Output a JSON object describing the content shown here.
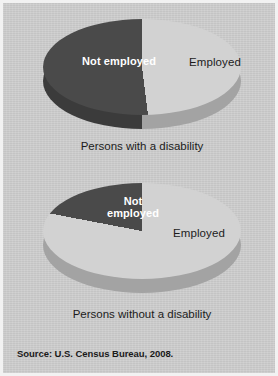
{
  "figure": {
    "background_color": "#cccccc",
    "frame_color": "#f2f2f2",
    "source_note": "Source: U.S. Census Bureau, 2008."
  },
  "palette": {
    "not_employed": "#4a4a4a",
    "not_employed_wall": "#3b3b3b",
    "employed": "#d2d2d2",
    "employed_wall": "#a3a3a3",
    "label_dark_text": "#ffffff",
    "label_light_text": "#1c1c1c"
  },
  "chart_data": [
    {
      "type": "pie",
      "id": "persons-with-a-disability",
      "title": "Persons with a disability",
      "caption": "Persons with a disability",
      "categories": [
        "Not employed",
        "Employed"
      ],
      "values": [
        52,
        48
      ],
      "value_unit": "percent",
      "colors": [
        "#4a4a4a",
        "#d2d2d2"
      ],
      "labels": [
        {
          "text": "Not employed",
          "slice": "Not employed",
          "style": "bold-white"
        },
        {
          "text": "Employed",
          "slice": "Employed",
          "style": "regular-dark"
        }
      ],
      "legend": "none",
      "three_d": true,
      "start_angle_deg": 0,
      "direction": "counterclockwise"
    },
    {
      "type": "pie",
      "id": "persons-without-a-disability",
      "title": "Persons without a disability",
      "caption": "Persons without a disability",
      "categories": [
        "Not employed",
        "Employed"
      ],
      "values": [
        22,
        78
      ],
      "value_unit": "percent",
      "colors": [
        "#4a4a4a",
        "#d2d2d2"
      ],
      "labels": [
        {
          "text": "Not\nemployed",
          "slice": "Not employed",
          "style": "bold-white"
        },
        {
          "text": "Employed",
          "slice": "Employed",
          "style": "regular-dark"
        }
      ],
      "legend": "none",
      "three_d": true,
      "start_angle_deg": 0,
      "direction": "counterclockwise"
    }
  ],
  "chart1": {
    "caption": "Persons with a disability",
    "label_not_employed": "Not employed",
    "label_employed": "Employed"
  },
  "chart2": {
    "caption": "Persons without a disability",
    "label_not_employed": "Not\nemployed",
    "label_employed": "Employed"
  }
}
